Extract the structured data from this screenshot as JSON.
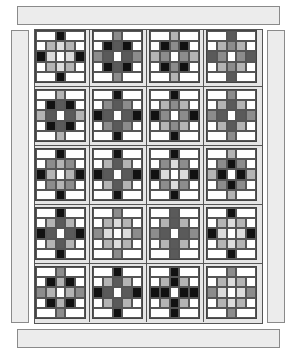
{
  "palette": {
    "white": "#ffffff",
    "verylight": "#dcdcdc",
    "lightgray": "#b4b4b4",
    "midgray": "#8c8c8c",
    "darkgray": "#5a5a5a",
    "black": "#111111",
    "sashing": "#e6e6e6",
    "border": "#ececec"
  },
  "layout": {
    "rows": 5,
    "cols": 4,
    "block_grid": "5x5 nine-patch star",
    "col_x": [
      35,
      92,
      149,
      206
    ],
    "row_y": [
      30,
      89,
      148,
      207,
      266
    ]
  },
  "blocks": [
    {
      "row": 0,
      "col": 0,
      "tip": "black",
      "corner": "lightgray",
      "inner": "verylight",
      "side": "black"
    },
    {
      "row": 0,
      "col": 1,
      "tip": "midgray",
      "corner": "black",
      "inner": "darkgray",
      "side": "midgray"
    },
    {
      "row": 0,
      "col": 2,
      "tip": "lightgray",
      "corner": "black",
      "inner": "midgray",
      "side": "lightgray"
    },
    {
      "row": 0,
      "col": 3,
      "tip": "darkgray",
      "corner": "lightgray",
      "inner": "midgray",
      "side": "darkgray"
    },
    {
      "row": 1,
      "col": 0,
      "tip": "lightgray",
      "corner": "black",
      "inner": "darkgray",
      "side": "lightgray"
    },
    {
      "row": 1,
      "col": 1,
      "tip": "black",
      "corner": "midgray",
      "inner": "darkgray",
      "side": "black"
    },
    {
      "row": 1,
      "col": 2,
      "tip": "black",
      "corner": "lightgray",
      "inner": "midgray",
      "side": "black"
    },
    {
      "row": 1,
      "col": 3,
      "tip": "midgray",
      "corner": "lightgray",
      "inner": "darkgray",
      "side": "midgray"
    },
    {
      "row": 2,
      "col": 0,
      "tip": "black",
      "corner": "midgray",
      "inner": "lightgray",
      "side": "black"
    },
    {
      "row": 2,
      "col": 1,
      "tip": "black",
      "corner": "lightgray",
      "inner": "darkgray",
      "side": "black"
    },
    {
      "row": 2,
      "col": 2,
      "tip": "black",
      "corner": "midgray",
      "inner": "verylight",
      "side": "black"
    },
    {
      "row": 2,
      "col": 3,
      "tip": "lightgray",
      "corner": "midgray",
      "inner": "black",
      "side": "lightgray"
    },
    {
      "row": 3,
      "col": 0,
      "tip": "black",
      "corner": "lightgray",
      "inner": "darkgray",
      "side": "black"
    },
    {
      "row": 3,
      "col": 1,
      "tip": "midgray",
      "corner": "lightgray",
      "inner": "verylight",
      "side": "midgray"
    },
    {
      "row": 3,
      "col": 2,
      "tip": "darkgray",
      "corner": "lightgray",
      "inner": "darkgray",
      "side": "midgray"
    },
    {
      "row": 3,
      "col": 3,
      "tip": "black",
      "corner": "lightgray",
      "inner": "verylight",
      "side": "black"
    },
    {
      "row": 4,
      "col": 0,
      "tip": "midgray",
      "corner": "black",
      "inner": "lightgray",
      "side": "midgray"
    },
    {
      "row": 4,
      "col": 1,
      "tip": "black",
      "corner": "lightgray",
      "inner": "darkgray",
      "side": "black"
    },
    {
      "row": 4,
      "col": 2,
      "tip": "black",
      "corner": "lightgray",
      "inner": "black",
      "side": "black"
    },
    {
      "row": 4,
      "col": 3,
      "tip": "midgray",
      "corner": "lightgray",
      "inner": "verylight",
      "side": "midgray"
    }
  ]
}
